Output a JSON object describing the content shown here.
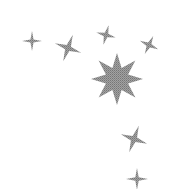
{
  "image": {
    "description": "Decorative cluster of gray stippled stars on white background",
    "background": "#ffffff",
    "star_color": "#8a8a8a",
    "star_dark": "#6e6e6e"
  },
  "stars": [
    {
      "name": "star-small-left",
      "points": 4,
      "cx": 32,
      "cy": 41,
      "r": 10,
      "inner": 2.2,
      "rot": 0
    },
    {
      "name": "star-left",
      "points": 4,
      "cx": 68,
      "cy": 48,
      "r": 14,
      "inner": 3.2,
      "rot": 20
    },
    {
      "name": "star-top-middle",
      "points": 4,
      "cx": 106,
      "cy": 35,
      "r": 10,
      "inner": 2.6,
      "rot": 15
    },
    {
      "name": "star-top-right",
      "points": 4,
      "cx": 149,
      "cy": 45,
      "r": 10,
      "inner": 2.6,
      "rot": 25
    },
    {
      "name": "star-large-center",
      "points": 8,
      "cx": 117,
      "cy": 79,
      "r": 26,
      "inner": 12,
      "rot": 0
    },
    {
      "name": "star-lower-right",
      "points": 4,
      "cx": 134,
      "cy": 139,
      "r": 14,
      "inner": 3.4,
      "rot": 20
    },
    {
      "name": "star-bottom",
      "points": 4,
      "cx": 137,
      "cy": 179,
      "r": 11,
      "inner": 2.4,
      "rot": 0
    }
  ]
}
